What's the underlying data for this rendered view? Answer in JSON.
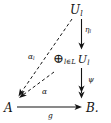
{
  "diagram": {
    "type": "commutative-diagram",
    "nodes": [
      {
        "id": "u-top",
        "label_main": "U",
        "label_sub": "l",
        "role": "object"
      },
      {
        "id": "direct-sum",
        "op": "⊕",
        "op_sub": "l∈L",
        "label_main": "U",
        "label_sub": "l",
        "role": "object"
      },
      {
        "id": "a",
        "label_main": "A",
        "label_sub": "",
        "role": "object"
      },
      {
        "id": "b",
        "label_main": "B.",
        "label_sub": "",
        "role": "object"
      }
    ],
    "edges": [
      {
        "id": "eta",
        "from": "u-top",
        "to": "direct-sum",
        "label": "η",
        "label_sub": "l",
        "style": "solid",
        "head": "single",
        "direction": "down"
      },
      {
        "id": "psi",
        "from": "direct-sum",
        "to": "b",
        "label": "ψ",
        "label_sub": "",
        "style": "solid",
        "head": "double",
        "direction": "down"
      },
      {
        "id": "g",
        "from": "a",
        "to": "b",
        "label": "g",
        "label_sub": "",
        "style": "solid",
        "head": "single",
        "direction": "right"
      },
      {
        "id": "alpha-l",
        "from": "u-top",
        "to": "a",
        "label": "α",
        "label_sub": "l",
        "style": "dashed",
        "head": "single",
        "direction": "down-left"
      },
      {
        "id": "alpha",
        "from": "direct-sum",
        "to": "a",
        "label": "α",
        "label_sub": "",
        "style": "dashed",
        "head": "single",
        "direction": "down-left"
      }
    ]
  },
  "colors": {
    "ink": "#141414",
    "background": "#ffffff"
  }
}
